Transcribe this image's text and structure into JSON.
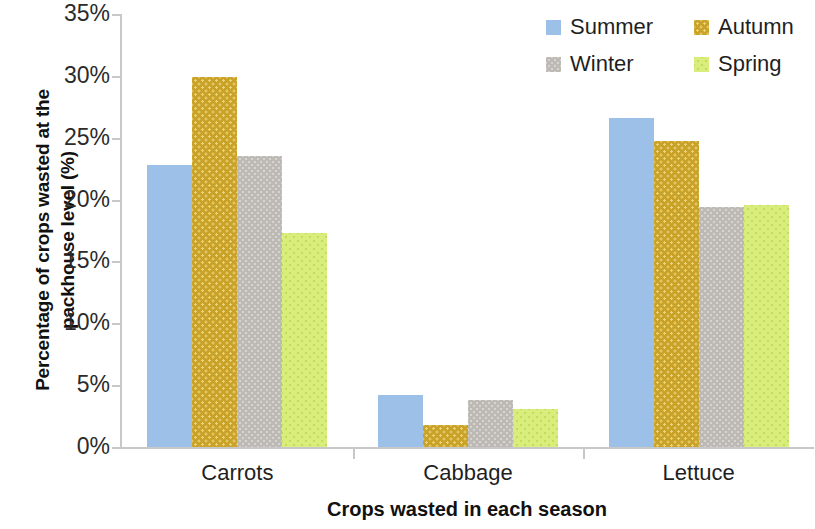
{
  "chart_data": {
    "type": "bar",
    "title": "",
    "xlabel": "Crops wasted in each season",
    "ylabel": "Percentage of crops wasted at the packhouse level (%)",
    "ylabel_line1": "Percentage of crops wasted at the",
    "ylabel_line2": "packhouse level (%)",
    "categories": [
      "Carrots",
      "Cabbage",
      "Lettuce"
    ],
    "series": [
      {
        "name": "Summer",
        "color": "#9cc0e8",
        "values": [
          22.8,
          4.2,
          26.6
        ]
      },
      {
        "name": "Autumn",
        "color": "#c9a227",
        "values": [
          29.9,
          1.8,
          24.7
        ]
      },
      {
        "name": "Winter",
        "color": "#bdbab6",
        "values": [
          23.5,
          3.8,
          19.4
        ]
      },
      {
        "name": "Spring",
        "color": "#d9ed7c",
        "values": [
          17.3,
          3.1,
          19.6
        ]
      }
    ],
    "ylim": [
      0,
      35
    ],
    "ytick_values": [
      0,
      5,
      10,
      15,
      20,
      25,
      30,
      35
    ],
    "ytick_labels": [
      "0%",
      "5%",
      "10%",
      "15%",
      "20%",
      "25%",
      "30%",
      "35%"
    ],
    "grid": false,
    "legend_position": "top-right",
    "legend_entries": [
      "Summer",
      "Autumn",
      "Winter",
      "Spring"
    ]
  }
}
